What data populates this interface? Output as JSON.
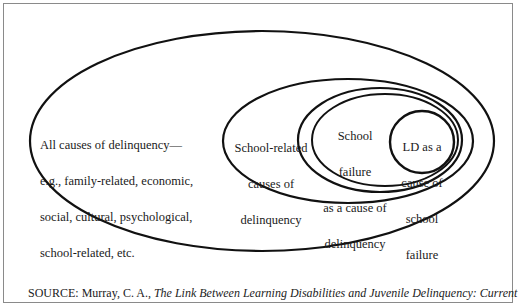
{
  "diagram": {
    "type": "nested-ellipses",
    "regions": [
      {
        "id": "all-causes",
        "label_lines": [
          "All causes of delinquency—",
          "e.g., family-related, economic,",
          "social, cultural, psychological,",
          "school-related, etc."
        ]
      },
      {
        "id": "school-related",
        "label_lines": [
          "School-related",
          "causes of",
          "delinquency"
        ]
      },
      {
        "id": "school-failure",
        "label_lines": [
          "School",
          "failure",
          "as a cause of",
          "delinquency"
        ]
      },
      {
        "id": "ld",
        "label_lines": [
          "LD as a",
          "cause of",
          "school",
          "failure"
        ]
      }
    ],
    "stroke_color": "#111111",
    "frame_color": "#8a8a8a"
  },
  "source": {
    "prefix": "SOURCE: Murray, C. A., ",
    "title": "The Link Between Learning Disabilities and Juvenile Delinquency: Current"
  }
}
